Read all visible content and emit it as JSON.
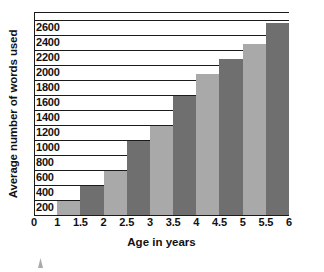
{
  "chart_data": {
    "type": "bar",
    "title": "",
    "xlabel": "Age in years",
    "ylabel": "Average number of words used",
    "categories": [
      "1.5",
      "2",
      "2.5",
      "3",
      "3.5",
      "4",
      "4.5",
      "5",
      "5.5",
      "6"
    ],
    "values": [
      180,
      380,
      580,
      980,
      1180,
      1580,
      1880,
      2080,
      2280,
      2550
    ],
    "x_tick_labels": [
      "0",
      "1",
      "1.5",
      "2",
      "2.5",
      "3",
      "3.5",
      "4",
      "4.5",
      "5",
      "5.5",
      "6"
    ],
    "y_tick_labels": [
      "2600",
      "2400",
      "2200",
      "2000",
      "1800",
      "1600",
      "1400",
      "1200",
      "1000",
      "800",
      "600",
      "400",
      "200"
    ],
    "ylim": [
      0,
      2700
    ],
    "y_tick_step": 200,
    "grid": true,
    "legend": "none",
    "series": [
      {
        "name": "Average number of words used",
        "values": [
          180,
          380,
          580,
          980,
          1180,
          1580,
          1880,
          2080,
          2280,
          2550
        ]
      }
    ],
    "bar_colors": [
      "#a9a9a9",
      "#6f6f6f",
      "#a9a9a9",
      "#6f6f6f",
      "#a9a9a9",
      "#6f6f6f",
      "#a9a9a9",
      "#6f6f6f",
      "#a9a9a9",
      "#6f6f6f"
    ],
    "colors": {
      "bar_light": "#a9a9a9",
      "bar_dark": "#6f6f6f",
      "axis": "#1b1b1b",
      "background": "#ffffff",
      "text": "#111111"
    }
  }
}
